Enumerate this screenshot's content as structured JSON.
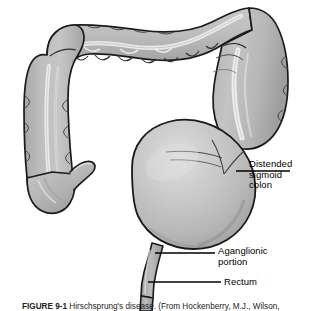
{
  "figure": {
    "caption_number": "FIGURE 9-1",
    "caption_text": "Hirschsprung's disease. (From Hockenberry, M.J., Wilson,",
    "alt_title": "Illustration of colon with distended sigmoid colon, aganglionic portion and rectum"
  },
  "annotations": {
    "distended_sigmoid": {
      "line1": "Distended",
      "line2": "sigmoid",
      "line3": "colon"
    },
    "aganglionic": {
      "line1": "Aganglionic",
      "line2": "portion"
    },
    "rectum": {
      "line1": "Rectum"
    }
  },
  "anatomy": {
    "parts": [
      "transverse-colon",
      "ascending-colon",
      "cecum",
      "appendix",
      "descending-colon",
      "distended-sigmoid-colon",
      "aganglionic-portion",
      "rectum"
    ]
  },
  "colors": {
    "outline": "#1a1a1a",
    "fill_mid": "#b4b4b4",
    "fill_light": "#d8d8d8",
    "fill_highlight": "#ececec",
    "fill_shadow": "#9a9a9a",
    "leader_line": "#000000",
    "background": "#ffffff",
    "text": "#000000"
  }
}
